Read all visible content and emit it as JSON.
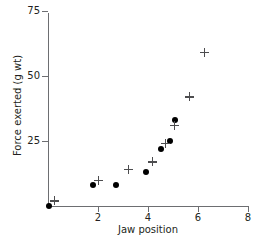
{
  "chart_data": {
    "type": "scatter",
    "title": "",
    "xlabel": "Jaw position",
    "ylabel": "Force exerted (g wt)",
    "xlim": [
      0,
      8
    ],
    "ylim": [
      0,
      75
    ],
    "xticks": [
      2,
      4,
      6,
      8
    ],
    "yticks": [
      25,
      50,
      75
    ],
    "grid": false,
    "legend": "none",
    "series": [
      {
        "name": "filled-circle",
        "marker": "circle",
        "color": "#000000",
        "points": [
          {
            "x": 0.05,
            "y": 0
          },
          {
            "x": 1.78,
            "y": 8
          },
          {
            "x": 2.72,
            "y": 8
          },
          {
            "x": 3.92,
            "y": 13
          },
          {
            "x": 4.5,
            "y": 22
          },
          {
            "x": 4.88,
            "y": 25
          },
          {
            "x": 5.08,
            "y": 33
          }
        ]
      },
      {
        "name": "plus",
        "marker": "plus",
        "color": "#4d4d4f",
        "points": [
          {
            "x": 0.25,
            "y": 2
          },
          {
            "x": 2.0,
            "y": 10
          },
          {
            "x": 3.22,
            "y": 14
          },
          {
            "x": 4.18,
            "y": 17
          },
          {
            "x": 4.68,
            "y": 24
          },
          {
            "x": 5.04,
            "y": 31
          },
          {
            "x": 5.66,
            "y": 42
          },
          {
            "x": 6.26,
            "y": 59
          }
        ]
      }
    ]
  }
}
